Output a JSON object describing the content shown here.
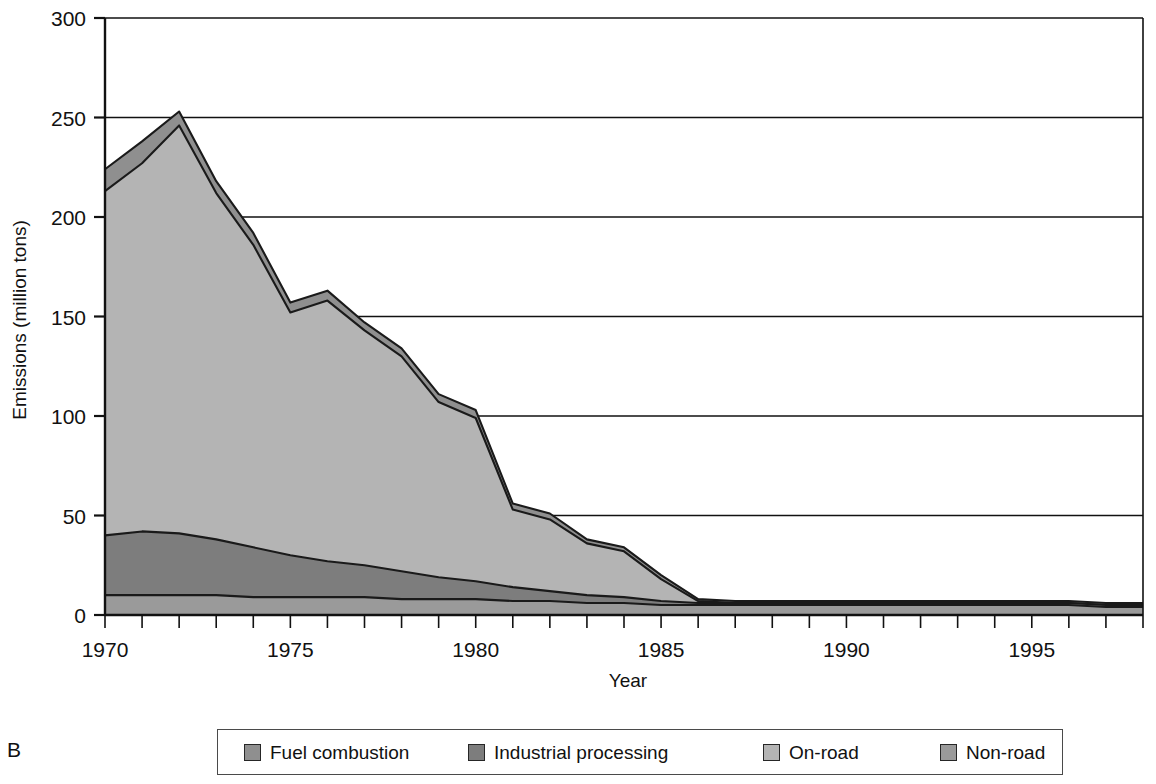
{
  "panel": {
    "label": "B"
  },
  "axes": {
    "ylabel": "Emissions (million tons)",
    "xlabel": "Year",
    "yticks": [
      "0",
      "50",
      "100",
      "150",
      "200",
      "250",
      "300"
    ],
    "xticks": [
      "1970",
      "1975",
      "1980",
      "1985",
      "1990",
      "1995"
    ]
  },
  "legend": {
    "items": [
      {
        "label": "Fuel combustion",
        "color": "#8f8f8f"
      },
      {
        "label": "Industrial processing",
        "color": "#7d7d7d"
      },
      {
        "label": "On-road",
        "color": "#b4b4b4"
      },
      {
        "label": "Non-road",
        "color": "#9a9a9a"
      }
    ]
  },
  "colors": {
    "fuel_combustion": "#8f8f8f",
    "industrial_processing": "#7d7d7d",
    "on_road": "#b4b4b4",
    "non_road": "#9a9a9a",
    "outline": "#1a1a1a",
    "grid": "#111111",
    "frame": "#111111"
  },
  "chart_data": {
    "type": "area",
    "stacked": true,
    "title": "",
    "xlabel": "Year",
    "ylabel": "Emissions (million tons)",
    "xlim": [
      1970,
      1998
    ],
    "ylim": [
      0,
      300
    ],
    "grid": true,
    "legend_position": "bottom",
    "x": [
      1970,
      1971,
      1972,
      1973,
      1974,
      1975,
      1976,
      1977,
      1978,
      1979,
      1980,
      1981,
      1982,
      1983,
      1984,
      1985,
      1986,
      1987,
      1988,
      1989,
      1990,
      1991,
      1992,
      1993,
      1994,
      1995,
      1996,
      1997,
      1998
    ],
    "series": [
      {
        "name": "Non-road",
        "values": [
          10,
          10,
          10,
          10,
          9,
          9,
          9,
          9,
          8,
          8,
          8,
          7,
          7,
          6,
          6,
          5,
          5,
          5,
          5,
          5,
          5,
          5,
          5,
          5,
          5,
          5,
          5,
          4,
          4
        ]
      },
      {
        "name": "Industrial processing",
        "values": [
          30,
          32,
          31,
          28,
          25,
          21,
          18,
          16,
          14,
          11,
          9,
          7,
          5,
          4,
          3,
          2,
          1,
          1,
          1,
          1,
          1,
          1,
          1,
          1,
          1,
          1,
          1,
          1,
          1
        ]
      },
      {
        "name": "On-road",
        "values": [
          173,
          185,
          205,
          174,
          152,
          122,
          131,
          118,
          108,
          88,
          82,
          39,
          36,
          26,
          23,
          11,
          1,
          0,
          0,
          0,
          0,
          0,
          0,
          0,
          0,
          0,
          0,
          0,
          0
        ]
      },
      {
        "name": "Fuel combustion",
        "values": [
          11,
          11,
          7,
          6,
          6,
          5,
          5,
          4,
          4,
          4,
          4,
          3,
          3,
          2,
          2,
          2,
          1,
          1,
          1,
          1,
          1,
          1,
          1,
          1,
          1,
          1,
          1,
          1,
          1
        ]
      }
    ],
    "totals": [
      224,
      238,
      253,
      218,
      192,
      157,
      163,
      147,
      134,
      111,
      104,
      56,
      51,
      38,
      34,
      20,
      8,
      7,
      7,
      7,
      7,
      6,
      6,
      6,
      6,
      6,
      6,
      5,
      5
    ]
  }
}
